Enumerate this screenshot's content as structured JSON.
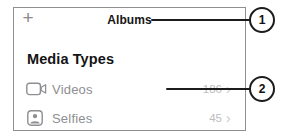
{
  "nav": {
    "add_button": "+",
    "title": "Albums"
  },
  "section_header": "Media Types",
  "rows": [
    {
      "icon": "video-camera-icon",
      "label": "Videos",
      "count": "186",
      "chevron": "›"
    },
    {
      "icon": "selfie-icon",
      "label": "Selfies",
      "count": "45",
      "chevron": "›"
    }
  ],
  "callouts": [
    {
      "number": "1"
    },
    {
      "number": "2"
    }
  ]
}
